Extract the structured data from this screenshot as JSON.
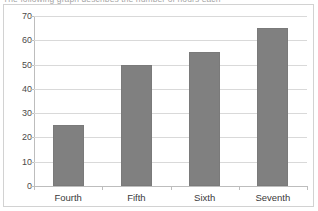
{
  "caption": {
    "partial_text": "The following graph describes the number of hours each"
  },
  "chart_data": {
    "type": "bar",
    "title": "",
    "xlabel": "",
    "ylabel": "",
    "categories": [
      "Fourth",
      "Fifth",
      "Sixth",
      "Seventh"
    ],
    "values": [
      25,
      50,
      55,
      65
    ],
    "ylim": [
      0,
      70
    ],
    "y_ticks": [
      0,
      10,
      20,
      30,
      40,
      50,
      60,
      70
    ],
    "y_tick_labels": [
      "0",
      "10",
      "20",
      "30",
      "40",
      "50",
      "60",
      "70"
    ],
    "grid": true,
    "legend": false,
    "series": [
      {
        "name": "",
        "values": [
          25,
          50,
          55,
          65
        ]
      }
    ],
    "colors": {
      "bar_fill": "#808080",
      "bar_border": "#7a7a7a",
      "gridline": "#d9d9d9",
      "axis": "#bdbdbd",
      "frame_border": "#d2d2d2",
      "background": "#ffffff",
      "text": "#3a3a3a"
    }
  }
}
